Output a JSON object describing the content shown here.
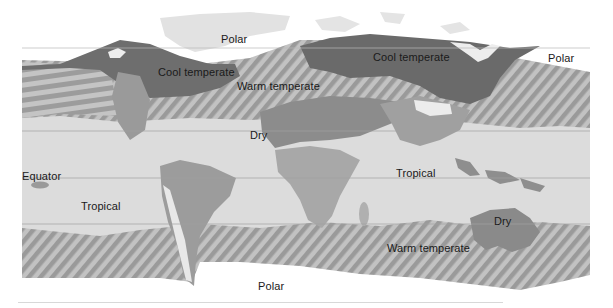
{
  "map": {
    "title": "World climate zones",
    "colors": {
      "polar": "#ffffff",
      "polar_land": "#e2e2e2",
      "cool_temperate": "#6e6e6e",
      "warm_temperate_hatch_a": "#9a9a9a",
      "warm_temperate_hatch_b": "#c4c4c4",
      "dry": "#8c8c8c",
      "tropical": "#dcdcdc",
      "land_mid": "#a8a8a8",
      "line": "#9a9a9a"
    },
    "labels": {
      "polar_north_america": "Polar",
      "polar_northeast": "Polar",
      "polar_south": "Polar",
      "cool_temperate_america": "Cool temperate",
      "cool_temperate_eurasia": "Cool temperate",
      "warm_temperate_north": "Warm temperate",
      "warm_temperate_south": "Warm temperate",
      "dry_africa": "Dry",
      "dry_australia": "Dry",
      "tropical_west": "Tropical",
      "tropical_east": "Tropical",
      "equator": "Equator"
    }
  }
}
